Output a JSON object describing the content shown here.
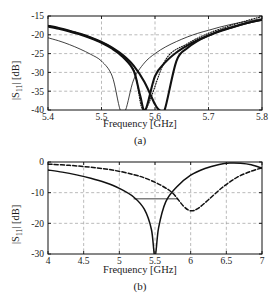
{
  "figure": {
    "panels": [
      {
        "id": "a",
        "caption": "(a)",
        "xlabel": "Frequency [GHz]",
        "ylabel_main": "|S",
        "ylabel_sub": "11",
        "ylabel_tail": "| [dB]"
      },
      {
        "id": "b",
        "caption": "(b)",
        "xlabel": "Frequency [GHz]",
        "ylabel_main": "|S",
        "ylabel_sub": "11",
        "ylabel_tail": "| [dB]"
      }
    ]
  },
  "chart_data": [
    {
      "type": "line",
      "panel": "a",
      "title": "",
      "xlabel": "Frequency [GHz]",
      "ylabel": "|S11| [dB]",
      "xlim": [
        5.4,
        5.8
      ],
      "ylim": [
        -40,
        -15
      ],
      "xticks": [
        5.4,
        5.5,
        5.6,
        5.7,
        5.8
      ],
      "xticklabels": [
        "5.4",
        "5.5",
        "5.6",
        "5.7",
        "5.8"
      ],
      "yticks": [
        -40,
        -35,
        -30,
        -25,
        -20,
        -15
      ],
      "yticklabels": [
        "-40",
        "-35",
        "-30",
        "-25",
        "-20",
        "-15"
      ],
      "grid": true,
      "grid_style": "dashed",
      "legend": "none",
      "series": [
        {
          "name": "thin-solid-curve",
          "style": "solid-thin",
          "resonance_ghz": 5.54,
          "x": [
            5.4,
            5.42,
            5.44,
            5.46,
            5.48,
            5.5,
            5.52,
            5.535,
            5.545,
            5.56,
            5.58,
            5.6,
            5.62,
            5.64,
            5.66,
            5.68,
            5.7,
            5.72,
            5.74,
            5.76,
            5.78,
            5.8
          ],
          "y": [
            -20.8,
            -21.6,
            -22.6,
            -23.8,
            -25.2,
            -27.0,
            -31.0,
            -40.0,
            -40.0,
            -32.0,
            -27.5,
            -25.0,
            -23.2,
            -21.8,
            -20.6,
            -19.6,
            -18.8,
            -18.0,
            -17.3,
            -16.7,
            -16.2,
            -15.7
          ]
        },
        {
          "name": "thick-solid-curve-1",
          "style": "solid-thick",
          "resonance_ghz": 5.58,
          "x": [
            5.4,
            5.42,
            5.44,
            5.46,
            5.48,
            5.5,
            5.52,
            5.54,
            5.56,
            5.572,
            5.582,
            5.6,
            5.62,
            5.64,
            5.66,
            5.68,
            5.7,
            5.72,
            5.74,
            5.76,
            5.78,
            5.8
          ],
          "y": [
            -17.8,
            -18.4,
            -19.1,
            -19.9,
            -20.9,
            -22.1,
            -23.7,
            -25.9,
            -29.5,
            -36.0,
            -40.0,
            -31.0,
            -27.2,
            -24.7,
            -22.9,
            -21.4,
            -20.2,
            -19.1,
            -18.2,
            -17.3,
            -16.6,
            -16.0
          ]
        },
        {
          "name": "thick-solid-curve-2",
          "style": "solid-thick",
          "resonance_ghz": 5.61,
          "x": [
            5.4,
            5.42,
            5.44,
            5.46,
            5.48,
            5.5,
            5.52,
            5.54,
            5.56,
            5.58,
            5.6,
            5.608,
            5.618,
            5.64,
            5.66,
            5.68,
            5.7,
            5.72,
            5.74,
            5.76,
            5.78,
            5.8
          ],
          "y": [
            -17.6,
            -18.2,
            -18.9,
            -19.7,
            -20.7,
            -21.9,
            -23.4,
            -25.4,
            -28.2,
            -32.5,
            -38.5,
            -40.0,
            -40.0,
            -27.0,
            -23.6,
            -21.6,
            -20.2,
            -19.0,
            -18.1,
            -17.3,
            -16.6,
            -16.0
          ]
        },
        {
          "name": "dotted-curve",
          "style": "dotted",
          "resonance_ghz": 5.58,
          "x": [
            5.4,
            5.44,
            5.48,
            5.52,
            5.56,
            5.58,
            5.62,
            5.66,
            5.7,
            5.74,
            5.78,
            5.8
          ],
          "y": [
            -17.6,
            -18.9,
            -20.7,
            -23.5,
            -29.3,
            -40.0,
            -26.6,
            -22.4,
            -19.6,
            -17.6,
            -15.9,
            -15.2
          ]
        }
      ]
    },
    {
      "type": "line",
      "panel": "b",
      "title": "",
      "xlabel": "Frequency [GHz]",
      "ylabel": "|S11| [dB]",
      "xlim": [
        4,
        7
      ],
      "ylim": [
        -30,
        0
      ],
      "xticks": [
        4,
        4.5,
        5,
        5.5,
        6,
        6.5,
        7
      ],
      "xticklabels": [
        "4",
        "4.5",
        "5",
        "5.5",
        "6",
        "6.5",
        "7"
      ],
      "yticks": [
        -30,
        -20,
        -10,
        0
      ],
      "yticklabels": [
        "-30",
        "-20",
        "-10",
        "0"
      ],
      "grid": true,
      "grid_style": "dashed",
      "legend": "none",
      "annotations": [
        {
          "name": "bandwidth-marker",
          "type": "horizontal-line",
          "y": -12.0,
          "x_start": 5.2,
          "x_end": 5.82,
          "color": "#808080"
        }
      ],
      "series": [
        {
          "name": "solid-curve",
          "style": "solid",
          "resonance_ghz": 5.5,
          "x": [
            4.0,
            4.2,
            4.4,
            4.6,
            4.8,
            5.0,
            5.2,
            5.35,
            5.45,
            5.5,
            5.55,
            5.65,
            5.8,
            6.0,
            6.2,
            6.4,
            6.55,
            6.7,
            6.85,
            7.0
          ],
          "y": [
            -2.6,
            -3.3,
            -4.2,
            -5.3,
            -6.7,
            -8.6,
            -11.4,
            -15.4,
            -22.0,
            -31.0,
            -21.5,
            -13.0,
            -8.2,
            -4.3,
            -2.1,
            -0.8,
            -0.35,
            -0.4,
            -0.9,
            -2.0
          ]
        },
        {
          "name": "dashed-curve",
          "style": "dashed",
          "resonance_ghz": 6.0,
          "x": [
            4.0,
            4.3,
            4.6,
            4.9,
            5.2,
            5.4,
            5.6,
            5.75,
            5.9,
            6.0,
            6.1,
            6.25,
            6.45,
            6.65,
            6.85,
            7.0
          ],
          "y": [
            -0.7,
            -1.1,
            -1.7,
            -2.6,
            -4.1,
            -5.6,
            -7.8,
            -10.2,
            -14.4,
            -15.9,
            -15.2,
            -12.3,
            -8.2,
            -5.0,
            -3.0,
            -1.9
          ]
        }
      ]
    }
  ]
}
